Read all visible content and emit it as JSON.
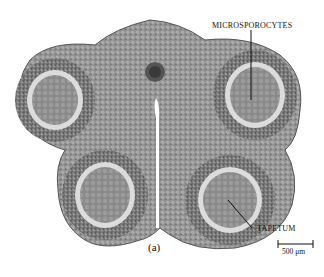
{
  "figure": {
    "labels": {
      "microsporocytes": "MICROSPOROCYTES",
      "tapetum": "TAPETUM"
    },
    "caption": "(a)",
    "scale_bar": {
      "label": "500 μm"
    }
  }
}
